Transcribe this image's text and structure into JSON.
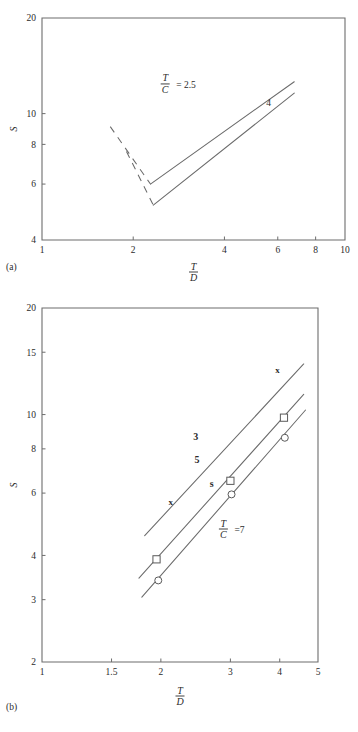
{
  "figure": {
    "panel_a_label": "(a)",
    "panel_b_label": "(b)"
  },
  "chart_data": [
    {
      "id": "panel-a",
      "type": "line",
      "title": "",
      "xlabel_numerator": "T",
      "xlabel_denominator": "D",
      "ylabel": "S",
      "xscale": "log",
      "yscale": "log",
      "xlim": [
        1,
        10
      ],
      "ylim": [
        4,
        20
      ],
      "xticks": [
        1,
        2,
        4,
        6,
        8,
        10
      ],
      "xtick_labels": [
        "1",
        "2",
        "4",
        "6",
        "8",
        "10"
      ],
      "yticks": [
        4,
        6,
        8,
        10,
        20
      ],
      "ytick_labels": [
        "4",
        "6",
        "8",
        "10",
        "20"
      ],
      "grid": false,
      "annotations": [
        {
          "name": "tc-ratio-annotation",
          "numerator": "T",
          "denominator": "C",
          "equals": "= 2.5",
          "x": 2.55,
          "y": 12.4
        },
        {
          "name": "series-label-4",
          "text": "4",
          "x": 5.6,
          "y": 10.6
        }
      ],
      "series": [
        {
          "name": "T/C = 2.5",
          "label": "2.5",
          "style": "solid",
          "points": [
            [
              2.28,
              6.0
            ],
            [
              6.8,
              12.6
            ]
          ],
          "dashed_branch": [
            [
              1.68,
              9.1
            ],
            [
              2.28,
              6.0
            ]
          ]
        },
        {
          "name": "T/C = 4",
          "label": "4",
          "style": "solid",
          "points": [
            [
              2.33,
              5.15
            ],
            [
              6.8,
              11.6
            ]
          ],
          "dashed_branch": [
            [
              1.9,
              7.6
            ],
            [
              2.33,
              5.15
            ]
          ]
        }
      ]
    },
    {
      "id": "panel-b",
      "type": "scatter",
      "title": "",
      "xlabel_numerator": "T",
      "xlabel_denominator": "D",
      "ylabel": "S",
      "xscale": "log",
      "yscale": "log",
      "xlim": [
        1,
        5
      ],
      "ylim": [
        2,
        20
      ],
      "xticks": [
        1,
        1.5,
        2,
        3,
        4,
        5
      ],
      "xtick_labels": [
        "1",
        "1.5",
        "2",
        "3",
        "4",
        "5"
      ],
      "yticks": [
        2,
        3,
        4,
        6,
        8,
        10,
        15,
        20
      ],
      "ytick_labels": [
        "2",
        "3",
        "4",
        "6",
        "8",
        "10",
        "15",
        "20"
      ],
      "grid": false,
      "annotations": [
        {
          "name": "series-label-3",
          "text": "3",
          "x": 2.45,
          "y": 8.45
        },
        {
          "name": "series-label-5",
          "text": "5",
          "x": 2.47,
          "y": 7.3
        },
        {
          "name": "series-label-s",
          "text": "s",
          "x": 2.69,
          "y": 6.25
        },
        {
          "name": "marker-x-left",
          "text": "x",
          "x": 2.12,
          "y": 5.55
        },
        {
          "name": "marker-x-right",
          "text": "x",
          "x": 3.95,
          "y": 13.1
        },
        {
          "name": "tc-ratio-annotation",
          "numerator": "T",
          "denominator": "C",
          "equals": "=7",
          "x": 2.88,
          "y": 4.75
        }
      ],
      "series": [
        {
          "name": "T/C = 3",
          "label": "3",
          "marker": "x",
          "style": "solid",
          "points": [
            [
              1.82,
              4.55
            ],
            [
              4.6,
              13.9
            ]
          ]
        },
        {
          "name": "T/C = 5",
          "label": "5",
          "marker": "square",
          "style": "solid",
          "points": [
            [
              1.76,
              3.45
            ],
            [
              4.6,
              11.4
            ]
          ],
          "data_points": [
            [
              1.95,
              3.9
            ],
            [
              3.0,
              6.5
            ],
            [
              4.1,
              9.8
            ]
          ]
        },
        {
          "name": "T/C = 7",
          "label": "7",
          "marker": "circle",
          "style": "solid",
          "points": [
            [
              1.79,
              3.05
            ],
            [
              4.65,
              10.3
            ]
          ],
          "data_points": [
            [
              1.97,
              3.4
            ],
            [
              3.02,
              5.95
            ],
            [
              4.12,
              8.6
            ]
          ]
        }
      ]
    }
  ]
}
